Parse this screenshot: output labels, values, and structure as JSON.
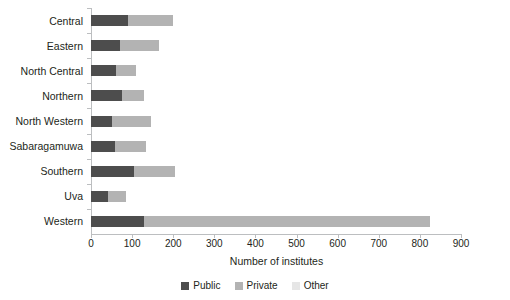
{
  "chart_data": {
    "type": "bar",
    "orientation": "horizontal",
    "stacked": true,
    "title": "",
    "xlabel": "Number of institutes",
    "ylabel": "",
    "xlim": [
      0,
      900
    ],
    "xticks": [
      0,
      100,
      200,
      300,
      400,
      500,
      600,
      700,
      800,
      900
    ],
    "grid": false,
    "legend_position": "bottom-center",
    "categories": [
      "Central",
      "Eastern",
      "North Central",
      "Northern",
      "North Western",
      "Sabaragamuwa",
      "Southern",
      "Uva",
      "Western"
    ],
    "series": [
      {
        "name": "Public",
        "color": "#4d4d4d",
        "values": [
          90,
          70,
          60,
          75,
          50,
          58,
          105,
          42,
          130
        ]
      },
      {
        "name": "Private",
        "color": "#b3b3b3",
        "values": [
          110,
          95,
          50,
          55,
          95,
          77,
          100,
          43,
          695
        ]
      },
      {
        "name": "Other",
        "color": "#e6e6e6",
        "values": [
          0,
          0,
          0,
          0,
          0,
          0,
          0,
          0,
          0
        ]
      }
    ],
    "totals": [
      200,
      165,
      110,
      130,
      145,
      135,
      205,
      85,
      825
    ]
  },
  "legend": {
    "items": [
      {
        "label": "Public",
        "color": "#4d4d4d"
      },
      {
        "label": "Private",
        "color": "#b3b3b3"
      },
      {
        "label": "Other",
        "color": "#e6e6e6"
      }
    ]
  },
  "axis": {
    "x_title": "Number of institutes"
  }
}
